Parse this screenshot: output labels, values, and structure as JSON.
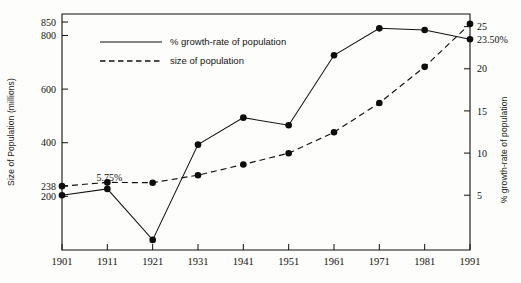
{
  "chart_data": {
    "type": "line",
    "title": "",
    "xlabel": "",
    "ylabel": "Size of Population (millions)",
    "y2label": "% growth-rate of population",
    "grid": false,
    "legend_position": "top-left-inside",
    "x": [
      1901,
      1911,
      1921,
      1931,
      1941,
      1951,
      1961,
      1971,
      1981,
      1991
    ],
    "xticklabels": [
      "1901",
      "1911",
      "1921",
      "1931",
      "1941",
      "1951",
      "1961",
      "1971",
      "1981",
      "1991"
    ],
    "ylim": [
      0,
      880
    ],
    "yticks": [
      200,
      238,
      400,
      600,
      800,
      850
    ],
    "yticklabels": [
      "200",
      "238",
      "400",
      "600",
      "800",
      "850"
    ],
    "y2lim": [
      -1.5,
      26.5
    ],
    "y2ticks": [
      5,
      10,
      15,
      20,
      25
    ],
    "y2ticklabels": [
      "5",
      "10",
      "15",
      "20",
      "25"
    ],
    "y2_extra_ticklabel": "23.50%",
    "series": [
      {
        "name": "% growth-rate of population",
        "axis": "right",
        "linestyle": "solid",
        "marker": "filled-circle",
        "values": [
          5.0,
          5.75,
          -0.3,
          11.0,
          14.2,
          13.3,
          21.6,
          24.8,
          24.6,
          23.5
        ]
      },
      {
        "name": "size of population",
        "axis": "left",
        "linestyle": "dashed",
        "marker": "filled-circle",
        "values": [
          238,
          252,
          251,
          279,
          319,
          361,
          439,
          548,
          683,
          843
        ]
      }
    ],
    "annotations": [
      {
        "text": "5.75%",
        "x": 1911,
        "series": "% growth-rate of population",
        "position": "above-left"
      }
    ],
    "legend_entries": [
      {
        "label": "% growth-rate of population",
        "linestyle": "solid"
      },
      {
        "label": "size of population",
        "linestyle": "dashed"
      }
    ]
  }
}
